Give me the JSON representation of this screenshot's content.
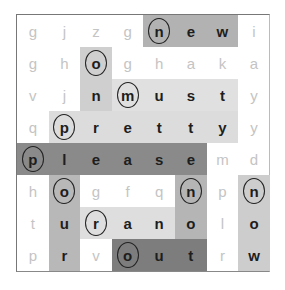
{
  "puzzle": {
    "rows": 8,
    "cols": 8,
    "grid": [
      [
        "g",
        "j",
        "z",
        "g",
        "n",
        "e",
        "w",
        "i"
      ],
      [
        "g",
        "h",
        "o",
        "g",
        "h",
        "a",
        "k",
        "a"
      ],
      [
        "v",
        "j",
        "n",
        "m",
        "u",
        "s",
        "t",
        "y"
      ],
      [
        "q",
        "p",
        "r",
        "e",
        "t",
        "t",
        "y",
        "y"
      ],
      [
        "p",
        "l",
        "e",
        "a",
        "s",
        "e",
        "m",
        "d"
      ],
      [
        "h",
        "o",
        "g",
        "f",
        "q",
        "n",
        "p",
        "n"
      ],
      [
        "t",
        "u",
        "r",
        "a",
        "n",
        "o",
        "l",
        "o"
      ],
      [
        "p",
        "r",
        "v",
        "o",
        "u",
        "t",
        "r",
        "w"
      ]
    ],
    "found_words": [
      {
        "word": "new",
        "start": [
          0,
          4
        ],
        "end": [
          0,
          6
        ],
        "direction": "horizontal",
        "color": "#b2b2b2"
      },
      {
        "word": "on",
        "start": [
          1,
          2
        ],
        "end": [
          2,
          2
        ],
        "direction": "vertical",
        "color": "#cfcfcf"
      },
      {
        "word": "must",
        "start": [
          2,
          3
        ],
        "end": [
          2,
          6
        ],
        "direction": "horizontal",
        "color": "#e0e0e0"
      },
      {
        "word": "pretty",
        "start": [
          3,
          1
        ],
        "end": [
          3,
          6
        ],
        "direction": "horizontal",
        "color": "#dcdcdc"
      },
      {
        "word": "please",
        "start": [
          4,
          0
        ],
        "end": [
          4,
          5
        ],
        "direction": "horizontal",
        "color": "#8a8a8a"
      },
      {
        "word": "our",
        "start": [
          5,
          1
        ],
        "end": [
          7,
          1
        ],
        "direction": "vertical",
        "color": "#b8b8b8"
      },
      {
        "word": "no",
        "start": [
          5,
          5
        ],
        "end": [
          6,
          5
        ],
        "direction": "vertical",
        "color": "#b5b5b5"
      },
      {
        "word": "now",
        "start": [
          5,
          7
        ],
        "end": [
          7,
          7
        ],
        "direction": "vertical",
        "color": "#cdcdcd"
      },
      {
        "word": "ran",
        "start": [
          6,
          2
        ],
        "end": [
          6,
          4
        ],
        "direction": "horizontal",
        "color": "#dedede"
      },
      {
        "word": "out",
        "start": [
          7,
          3
        ],
        "end": [
          7,
          5
        ],
        "direction": "horizontal",
        "color": "#7d7d7d"
      }
    ],
    "circled_cells": [
      [
        0,
        4
      ],
      [
        1,
        2
      ],
      [
        2,
        3
      ],
      [
        3,
        1
      ],
      [
        4,
        0
      ],
      [
        5,
        1
      ],
      [
        5,
        5
      ],
      [
        5,
        7
      ],
      [
        6,
        2
      ],
      [
        7,
        3
      ]
    ]
  }
}
